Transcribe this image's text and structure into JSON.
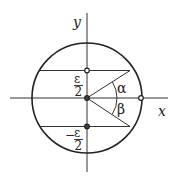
{
  "diagram": {
    "type": "geometry",
    "axes": {
      "x_label": "x",
      "y_label": "y"
    },
    "labels": {
      "eps_pos_num": "ε",
      "eps_pos_den": "2",
      "eps_neg_sign": "−",
      "eps_neg_num": "ε",
      "eps_neg_den": "2",
      "alpha": "α",
      "beta": "β"
    },
    "points": [
      {
        "name": "center",
        "x": 0,
        "y": 0
      },
      {
        "name": "upper-chord-point",
        "x": 0,
        "y": "ε/2"
      },
      {
        "name": "lower-chord-point",
        "x": 0,
        "y": "-ε/2"
      },
      {
        "name": "circle-x-intercept",
        "x": "r",
        "y": 0
      }
    ],
    "colors": {
      "stroke": "#222222",
      "background": "#ffffff"
    }
  }
}
